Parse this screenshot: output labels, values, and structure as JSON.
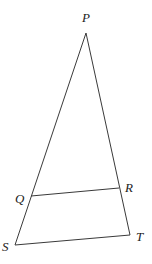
{
  "figure": {
    "type": "triangle-with-parallel-segment",
    "line_color": "#3a3a3a",
    "label_color": "#222222",
    "points": {
      "P": {
        "label": "P",
        "x": 86,
        "y": 33,
        "lx": 82,
        "ly": 22
      },
      "Q": {
        "label": "Q",
        "x": 31,
        "y": 196,
        "lx": 15,
        "ly": 203
      },
      "R": {
        "label": "R",
        "x": 119,
        "y": 188,
        "lx": 125,
        "ly": 192
      },
      "S": {
        "label": "S",
        "x": 15,
        "y": 245,
        "lx": 2,
        "ly": 251
      },
      "T": {
        "label": "T",
        "x": 130,
        "y": 235,
        "lx": 136,
        "ly": 241
      }
    },
    "segments": [
      {
        "from": "P",
        "to": "S"
      },
      {
        "from": "P",
        "to": "T"
      },
      {
        "from": "Q",
        "to": "R"
      },
      {
        "from": "S",
        "to": "T"
      }
    ]
  }
}
